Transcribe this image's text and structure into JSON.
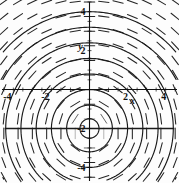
{
  "figure": {
    "kind": "slope-field",
    "background_color": "#fdfdfd",
    "ink_color": "#1a1a1a",
    "axis_color": "#111111"
  },
  "axes": {
    "x_label": "x",
    "y_label": "y",
    "x_ticks": [
      {
        "value": -4,
        "label": "-4"
      },
      {
        "value": -2,
        "label": "-2"
      },
      {
        "value": 2,
        "label": "2"
      },
      {
        "value": 4,
        "label": "4"
      }
    ],
    "y_ticks": [
      {
        "value": 4,
        "label": "4"
      },
      {
        "value": 2,
        "label": "2"
      },
      {
        "value": -2,
        "label": "-2"
      },
      {
        "value": -4,
        "label": "-4"
      }
    ]
  },
  "chart_data": {
    "type": "line",
    "title": "",
    "xlabel": "x",
    "ylabel": "y",
    "xlim": [
      -4.7,
      4.7
    ],
    "ylim": [
      -4.8,
      4.6
    ],
    "grid": false,
    "legend": "none",
    "slope_field": {
      "equation": "dy/dx = -x/(y+2)",
      "x_range": [
        -4.5,
        4.5
      ],
      "y_range": [
        -4.5,
        4.5
      ],
      "x_step": 0.75,
      "y_step": 0.75,
      "segment_length": 0.55
    },
    "equilibrium_lines": [
      {
        "y": -2,
        "note": "horizontal line y = -2"
      }
    ],
    "solution_curves": [
      {
        "name": "c=0.5",
        "family": "x^2 + (y+2)^2 = c^2",
        "c": 0.5
      },
      {
        "name": "c=1.2",
        "family": "x^2 + (y+2)^2 = c^2",
        "c": 1.2
      },
      {
        "name": "c=2.0",
        "family": "x^2 + (y+2)^2 = c^2",
        "c": 2.0
      },
      {
        "name": "c=2.8",
        "family": "x^2 + (y+2)^2 = c^2",
        "c": 2.8
      },
      {
        "name": "c=3.6",
        "family": "x^2 + (y+2)^2 = c^2",
        "c": 3.6
      },
      {
        "name": "c=4.4",
        "family": "x^2 + (y+2)^2 = c^2",
        "c": 4.4
      },
      {
        "name": "c=5.2",
        "family": "x^2 + (y+2)^2 = c^2",
        "c": 5.2
      },
      {
        "name": "c=6.0",
        "family": "x^2 + (y+2)^2 = c^2",
        "c": 6.0
      }
    ]
  }
}
